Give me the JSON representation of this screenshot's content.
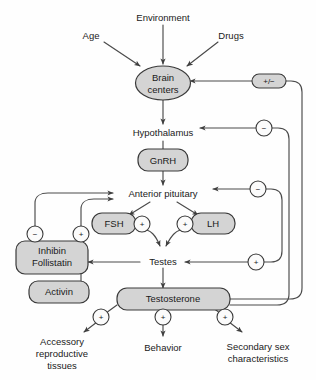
{
  "diagram": {
    "colors": {
      "node_fill": "#d4d4d4",
      "node_stroke": "#3a3a3a",
      "line": "#4a4a4a",
      "text": "#1a1a1a",
      "background": "#fefefe"
    },
    "inputs": [
      {
        "id": "environment",
        "label": "Environment"
      },
      {
        "id": "age",
        "label": "Age"
      },
      {
        "id": "drugs",
        "label": "Drugs"
      }
    ],
    "nodes": [
      {
        "id": "brain-centers",
        "label_line1": "Brain",
        "label_line2": "centers",
        "shape": "ellipse",
        "filled": true
      },
      {
        "id": "hypothalamus",
        "label": "Hypothalamus",
        "shape": "plain",
        "filled": false
      },
      {
        "id": "gnrh",
        "label": "GnRH",
        "shape": "rounded-rect",
        "filled": true
      },
      {
        "id": "anterior-pituitary",
        "label": "Anterior pituitary",
        "shape": "plain",
        "filled": false
      },
      {
        "id": "fsh",
        "label": "FSH",
        "shape": "rounded-rect",
        "filled": true
      },
      {
        "id": "lh",
        "label": "LH",
        "shape": "rounded-rect",
        "filled": true
      },
      {
        "id": "inhibin-follistatin",
        "label_line1": "Inhibin",
        "label_line2": "Follistatin",
        "shape": "rounded-rect",
        "filled": true
      },
      {
        "id": "activin",
        "label": "Activin",
        "shape": "rounded-rect",
        "filled": true
      },
      {
        "id": "testes",
        "label": "Testes",
        "shape": "plain",
        "filled": false
      },
      {
        "id": "testosterone",
        "label": "Testosterone",
        "shape": "rounded-rect",
        "filled": true
      }
    ],
    "outputs": [
      {
        "id": "accessory-reproductive-tissues",
        "line1": "Accessory",
        "line2": "reproductive",
        "line3": "tissues"
      },
      {
        "id": "behavior",
        "line1": "Behavior",
        "line2": "",
        "line3": ""
      },
      {
        "id": "secondary-sex-characteristics",
        "line1": "Secondary sex",
        "line2": "characteristics",
        "line3": ""
      }
    ],
    "signs": [
      {
        "id": "sign-brain-centers-feedback",
        "label": "+/−",
        "shape": "stadium"
      },
      {
        "id": "sign-hypothalamus-feedback",
        "label": "−",
        "shape": "circle"
      },
      {
        "id": "sign-anterior-pituitary-feedback",
        "label": "−",
        "shape": "circle"
      },
      {
        "id": "sign-testes-feedback-plus",
        "label": "+",
        "shape": "circle"
      },
      {
        "id": "sign-inhibin-negative",
        "label": "−",
        "shape": "circle"
      },
      {
        "id": "sign-activin-positive",
        "label": "+",
        "shape": "circle"
      },
      {
        "id": "sign-fsh-positive",
        "label": "+",
        "shape": "circle"
      },
      {
        "id": "sign-lh-positive",
        "label": "+",
        "shape": "circle"
      },
      {
        "id": "sign-accessory-positive",
        "label": "+",
        "shape": "circle"
      },
      {
        "id": "sign-behavior-positive",
        "label": "+",
        "shape": "circle"
      },
      {
        "id": "sign-secondary-sex-positive",
        "label": "+",
        "shape": "circle"
      }
    ]
  }
}
